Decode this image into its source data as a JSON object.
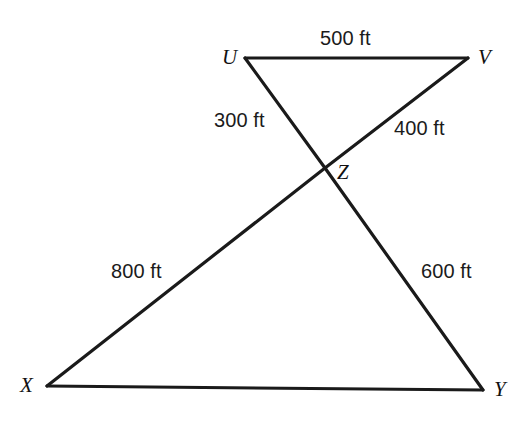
{
  "figure": {
    "type": "geometry-diagram",
    "background_color": "#ffffff",
    "stroke_color": "#1a1a1a",
    "canvas": {
      "width": 527,
      "height": 427
    }
  },
  "vertices": [
    {
      "id": "U",
      "label": "U",
      "x": 245,
      "y": 58,
      "label_x": 222,
      "label_y": 47
    },
    {
      "id": "V",
      "label": "V",
      "x": 468,
      "y": 58,
      "label_x": 478,
      "label_y": 47
    },
    {
      "id": "Z",
      "label": "Z",
      "x": 325,
      "y": 168,
      "label_x": 337,
      "label_y": 162
    },
    {
      "id": "X",
      "label": "X",
      "x": 47,
      "y": 386,
      "label_x": 20,
      "label_y": 375
    },
    {
      "id": "Y",
      "label": "Y",
      "x": 483,
      "y": 390,
      "label_x": 494,
      "label_y": 379
    }
  ],
  "segments": [
    {
      "id": "UV",
      "from": "U",
      "to": "V",
      "measure": "500 ft"
    },
    {
      "id": "UZ",
      "from": "U",
      "to": "Z",
      "measure": "300 ft"
    },
    {
      "id": "VZ",
      "from": "V",
      "to": "Z",
      "measure": "400 ft"
    },
    {
      "id": "XZ",
      "from": "X",
      "to": "Z",
      "measure": "800 ft"
    },
    {
      "id": "YZ",
      "from": "Y",
      "to": "Z",
      "measure": "600 ft"
    },
    {
      "id": "XY",
      "from": "X",
      "to": "Y",
      "measure": ""
    }
  ],
  "lines": [
    {
      "id": "line-U-Y",
      "points": "245,58 483,390",
      "note": "straight line from U through Z to Y"
    },
    {
      "id": "line-V-X",
      "points": "468,58 47,386",
      "note": "straight line from V through Z to X"
    },
    {
      "id": "line-U-V",
      "points": "245,58 468,58",
      "note": "top edge"
    },
    {
      "id": "line-X-Y",
      "points": "47,386 483,390",
      "note": "bottom edge"
    }
  ],
  "measure_labels": [
    {
      "id": "measure-UV",
      "text": "500 ft",
      "x": 320,
      "y": 28
    },
    {
      "id": "measure-UZ",
      "text": "300 ft",
      "x": 214,
      "y": 110
    },
    {
      "id": "measure-VZ",
      "text": "400 ft",
      "x": 394,
      "y": 118
    },
    {
      "id": "measure-XZ",
      "text": "800 ft",
      "x": 111,
      "y": 261
    },
    {
      "id": "measure-YZ",
      "text": "600 ft",
      "x": 421,
      "y": 261
    }
  ]
}
